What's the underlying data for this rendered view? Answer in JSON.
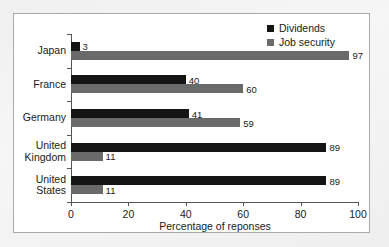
{
  "chart_data": {
    "type": "bar",
    "orientation": "horizontal",
    "title": "",
    "xlabel": "Percentage of reponses",
    "ylabel": "",
    "xlim": [
      0,
      100
    ],
    "xticks": [
      0,
      20,
      40,
      60,
      80,
      100
    ],
    "grid": false,
    "legend_position": "top-right",
    "categories": [
      "Japan",
      "France",
      "Germany",
      "United Kingdom",
      "United States"
    ],
    "category_lines": [
      [
        "Japan"
      ],
      [
        "France"
      ],
      [
        "Germany"
      ],
      [
        "United",
        "Kingdom"
      ],
      [
        "United",
        "States"
      ]
    ],
    "series": [
      {
        "name": "Dividends",
        "color": "#141414",
        "values": [
          3,
          40,
          41,
          89,
          89
        ]
      },
      {
        "name": "Job security",
        "color": "#6a6a6a",
        "values": [
          97,
          60,
          59,
          11,
          11
        ]
      }
    ]
  },
  "legend": {
    "items": [
      {
        "label": "Dividends"
      },
      {
        "label": "Job security"
      }
    ]
  },
  "axis": {
    "x_title": "Percentage of reponses",
    "x_tick_labels": [
      "0",
      "20",
      "40",
      "60",
      "80",
      "100"
    ]
  }
}
